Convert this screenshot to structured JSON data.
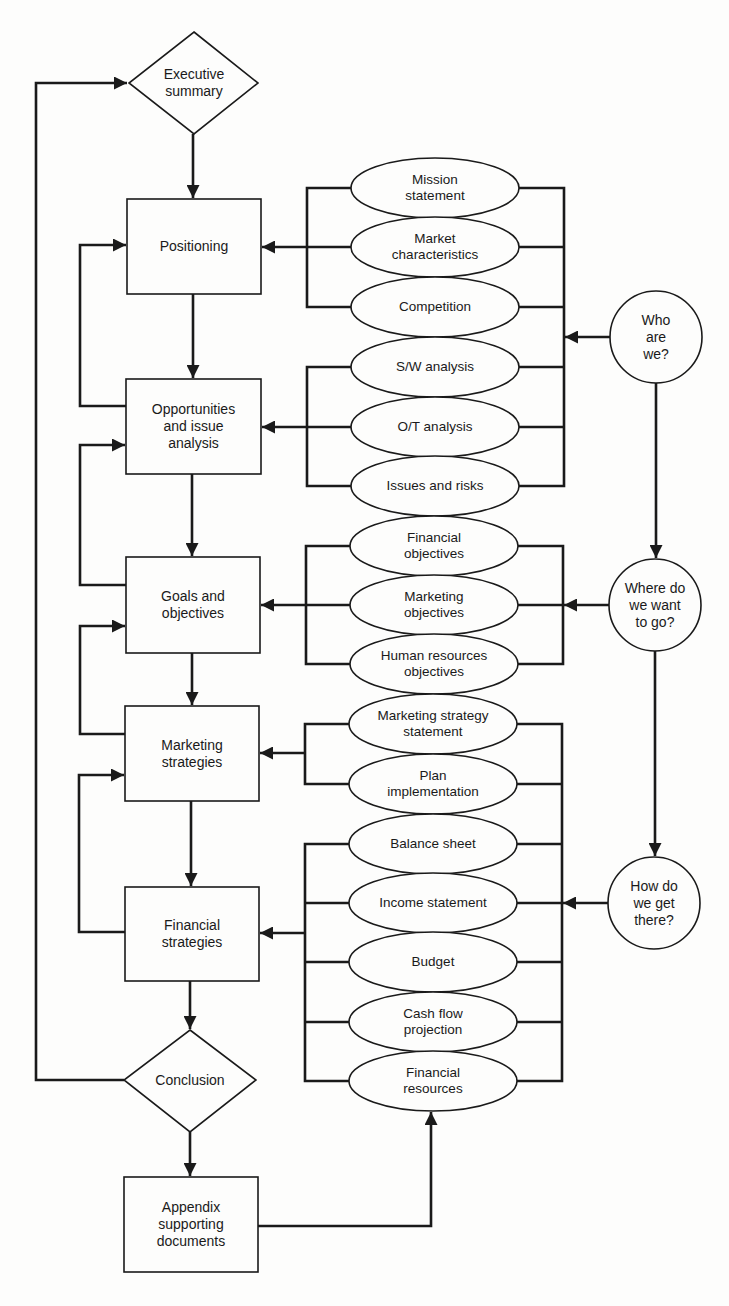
{
  "diagram": {
    "type": "flowchart",
    "stroke_color": "#1a1a1a",
    "background": "#fdfdfc",
    "main_flow": [
      {
        "id": "exec",
        "shape": "diamond",
        "label": "Executive\nsummary"
      },
      {
        "id": "positioning",
        "shape": "rect",
        "label": "Positioning"
      },
      {
        "id": "opportunities",
        "shape": "rect",
        "label": "Opportunities\nand issue\nanalysis"
      },
      {
        "id": "goals",
        "shape": "rect",
        "label": "Goals and\nobjectives"
      },
      {
        "id": "marketing",
        "shape": "rect",
        "label": "Marketing\nstrategies"
      },
      {
        "id": "financial",
        "shape": "rect",
        "label": "Financial\nstrategies"
      },
      {
        "id": "conclusion",
        "shape": "diamond",
        "label": "Conclusion"
      },
      {
        "id": "appendix",
        "shape": "rect",
        "label": "Appendix\nsupporting\ndocuments"
      }
    ],
    "inputs": [
      {
        "label": "Mission\nstatement"
      },
      {
        "label": "Market\ncharacteristics"
      },
      {
        "label": "Competition"
      },
      {
        "label": "S/W analysis"
      },
      {
        "label": "O/T analysis"
      },
      {
        "label": "Issues and risks"
      },
      {
        "label": "Financial\nobjectives"
      },
      {
        "label": "Marketing\nobjectives"
      },
      {
        "label": "Human resources\nobjectives"
      },
      {
        "label": "Marketing strategy\nstatement"
      },
      {
        "label": "Plan\nimplementation"
      },
      {
        "label": "Balance sheet"
      },
      {
        "label": "Income statement"
      },
      {
        "label": "Budget"
      },
      {
        "label": "Cash flow\nprojection"
      },
      {
        "label": "Financial\nresources"
      }
    ],
    "questions": [
      {
        "label": "Who\nare\nwe?"
      },
      {
        "label": "Where do\nwe want\nto go?"
      },
      {
        "label": "How do\nwe get\nthere?"
      }
    ]
  }
}
